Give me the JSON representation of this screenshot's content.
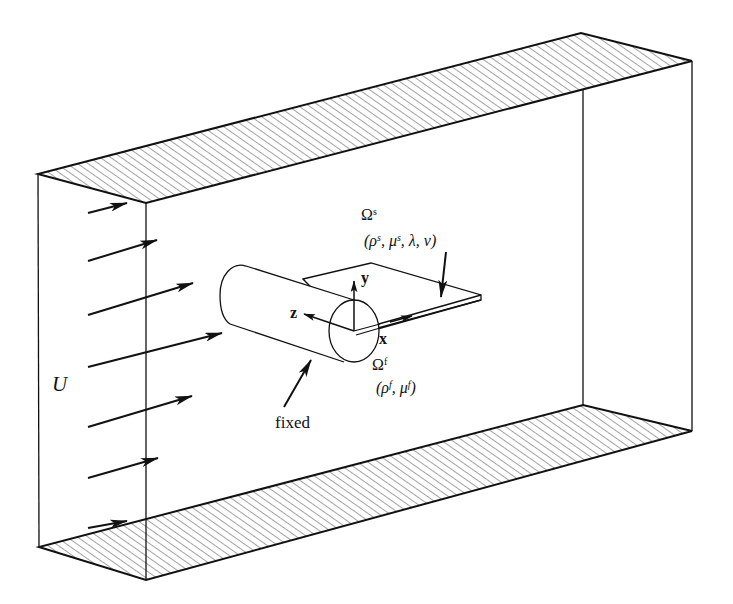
{
  "figure": {
    "type": "schematic"
  },
  "colors": {
    "line": "#111111",
    "hatch": "#555555",
    "background": "#ffffff"
  },
  "labels": {
    "inflow_velocity": "U",
    "solid_domain": {
      "symbol": "Ω",
      "sup": "s",
      "params_open": "(ρ",
      "params_sup1": "s",
      "params_mid": ", μ",
      "params_sup2": "s",
      "params_tail": ", λ, ν)"
    },
    "fluid_domain": {
      "symbol": "Ω",
      "sup": "f",
      "params_open": "(ρ",
      "params_sup1": "f",
      "params_mid": ", μ",
      "params_sup2": "f",
      "params_close": ")"
    },
    "fixed": "fixed",
    "axis_x": "x",
    "axis_y": "y",
    "axis_z": "z"
  },
  "inflow_arrows": {
    "count": 7
  },
  "walls": [
    "top wall (hatched)",
    "bottom wall (hatched)"
  ]
}
